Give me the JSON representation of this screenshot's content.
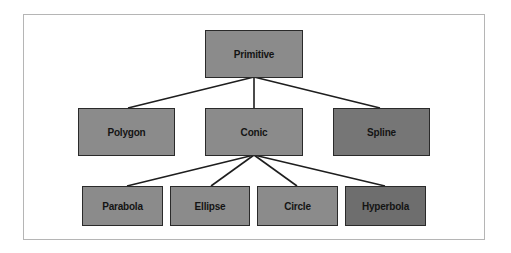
{
  "diagram": {
    "type": "tree",
    "root": {
      "id": "primitive",
      "label": "Primitive"
    },
    "level1": [
      {
        "id": "polygon",
        "label": "Polygon",
        "parent": "primitive"
      },
      {
        "id": "conic",
        "label": "Conic",
        "parent": "primitive"
      },
      {
        "id": "spline",
        "label": "Spline",
        "parent": "primitive"
      }
    ],
    "level2": [
      {
        "id": "parabola",
        "label": "Parabola",
        "parent": "conic"
      },
      {
        "id": "ellipse",
        "label": "Ellipse",
        "parent": "conic"
      },
      {
        "id": "circle",
        "label": "Circle",
        "parent": "conic"
      },
      {
        "id": "hyperbola",
        "label": "Hyperbola",
        "parent": "conic"
      }
    ],
    "colors": {
      "node_fill": "#8b8b8b",
      "node_fill_dark": "#767676",
      "node_border": "#2a2a2a",
      "edge": "#1e1e1e",
      "frame_border": "#b5b5b5"
    }
  }
}
